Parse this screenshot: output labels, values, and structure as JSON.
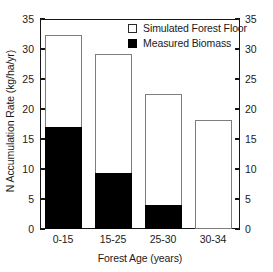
{
  "chart_data": {
    "type": "bar",
    "subtype": "overlaid-grouped",
    "title": "",
    "xlabel": "Forest Age (years)",
    "ylabel": "N Accumulation Rate (kg/ha/yr)",
    "categories": [
      "0-15",
      "15-25",
      "25-30",
      "30-34"
    ],
    "series": [
      {
        "name": "Simulated Forest Floor",
        "values": [
          32.3,
          29.1,
          22.5,
          18.1
        ],
        "fill": "#ffffff",
        "edge": "#7d7d7d"
      },
      {
        "name": "Measured Biomass",
        "values": [
          17.0,
          9.4,
          4.0,
          0
        ],
        "fill": "#000000",
        "edge": "#000000"
      }
    ],
    "ylim": [
      0,
      35
    ],
    "yticks": [
      0,
      5,
      10,
      15,
      20,
      25,
      30,
      35
    ],
    "ytick_labels": [
      "0",
      "5",
      "10",
      "15",
      "20",
      "25",
      "30",
      "35"
    ],
    "right_axis_mirrored": true,
    "right_ytick_labels": [
      "0",
      "5",
      "10",
      "15",
      "20",
      "25",
      "30",
      "35"
    ],
    "grid": false,
    "legend_position": "top-right-inside",
    "frame_color": "#161616",
    "background": "#ffffff"
  },
  "legend": {
    "entries": [
      {
        "label": "Simulated Forest Floor",
        "swatch": "open-square"
      },
      {
        "label": "Measured Biomass",
        "swatch": "filled-square"
      }
    ]
  }
}
